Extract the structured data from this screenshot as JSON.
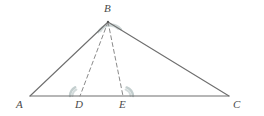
{
  "figure": {
    "background_color": "#ffffff",
    "stroke_color": "#6e6e6e",
    "dash_color": "#8a8a8a",
    "arc_color": "#b8c4c4",
    "label_color": "#4a4a4a"
  },
  "points": {
    "A": {
      "label": "A",
      "x": 30,
      "y": 96,
      "label_x": 16,
      "label_y": 99
    },
    "B": {
      "label": "B",
      "x": 108,
      "y": 22,
      "label_x": 104,
      "label_y": 3
    },
    "C": {
      "label": "C",
      "x": 229,
      "y": 96,
      "label_x": 233,
      "label_y": 99
    },
    "D": {
      "label": "D",
      "x": 80,
      "y": 96,
      "label_x": 75,
      "label_y": 99
    },
    "E": {
      "label": "E",
      "x": 123,
      "y": 96,
      "label_x": 119,
      "label_y": 99
    }
  },
  "segments": [
    {
      "name": "side-AB",
      "from": "A",
      "to": "B",
      "style": "solid"
    },
    {
      "name": "side-BC",
      "from": "B",
      "to": "C",
      "style": "solid"
    },
    {
      "name": "side-AC",
      "from": "A",
      "to": "C",
      "style": "solid"
    },
    {
      "name": "cevian-BD",
      "from": "B",
      "to": "D",
      "style": "dashed"
    },
    {
      "name": "cevian-BE",
      "from": "B",
      "to": "E",
      "style": "dashed"
    }
  ],
  "angle_marks": [
    {
      "name": "angle-ABD",
      "at": "B",
      "radius": 14
    },
    {
      "name": "angle-DBE",
      "at": "B",
      "radius": 11
    },
    {
      "name": "angle-BDA",
      "at": "D",
      "radius": 10
    },
    {
      "name": "angle-BEC",
      "at": "E",
      "radius": 10
    }
  ]
}
